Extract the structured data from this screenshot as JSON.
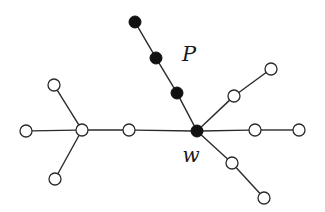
{
  "diagram": {
    "type": "tree-graph",
    "labels": [
      {
        "id": "P",
        "text": "P",
        "x": 189,
        "y": 61,
        "size": 21
      },
      {
        "id": "w",
        "text": "w",
        "x": 191,
        "y": 162,
        "size": 20
      }
    ],
    "nodes": [
      {
        "id": "p1",
        "x": 135,
        "y": 22,
        "filled": true
      },
      {
        "id": "p2",
        "x": 156,
        "y": 58,
        "filled": true
      },
      {
        "id": "p3",
        "x": 177,
        "y": 93,
        "filled": true
      },
      {
        "id": "w",
        "x": 197,
        "y": 131,
        "filled": true
      },
      {
        "id": "ur1",
        "x": 234,
        "y": 96,
        "filled": false
      },
      {
        "id": "ur2",
        "x": 271,
        "y": 69,
        "filled": false
      },
      {
        "id": "r1",
        "x": 255,
        "y": 130,
        "filled": false
      },
      {
        "id": "r2",
        "x": 299,
        "y": 130,
        "filled": false
      },
      {
        "id": "lr1",
        "x": 232,
        "y": 163,
        "filled": false
      },
      {
        "id": "lr2",
        "x": 264,
        "y": 198,
        "filled": false
      },
      {
        "id": "m",
        "x": 129,
        "y": 130,
        "filled": false
      },
      {
        "id": "c",
        "x": 82,
        "y": 130,
        "filled": false
      },
      {
        "id": "lt",
        "x": 54,
        "y": 85,
        "filled": false
      },
      {
        "id": "ll",
        "x": 26,
        "y": 131,
        "filled": false
      },
      {
        "id": "lb",
        "x": 55,
        "y": 179,
        "filled": false
      }
    ],
    "edges": [
      [
        "p1",
        "p2"
      ],
      [
        "p2",
        "p3"
      ],
      [
        "p3",
        "w"
      ],
      [
        "w",
        "ur1"
      ],
      [
        "ur1",
        "ur2"
      ],
      [
        "w",
        "r1"
      ],
      [
        "r1",
        "r2"
      ],
      [
        "w",
        "lr1"
      ],
      [
        "lr1",
        "lr2"
      ],
      [
        "w",
        "m"
      ],
      [
        "m",
        "c"
      ],
      [
        "c",
        "lt"
      ],
      [
        "c",
        "ll"
      ],
      [
        "c",
        "lb"
      ]
    ],
    "node_radius": 6,
    "path_label": "P",
    "vertex_label": "w"
  }
}
